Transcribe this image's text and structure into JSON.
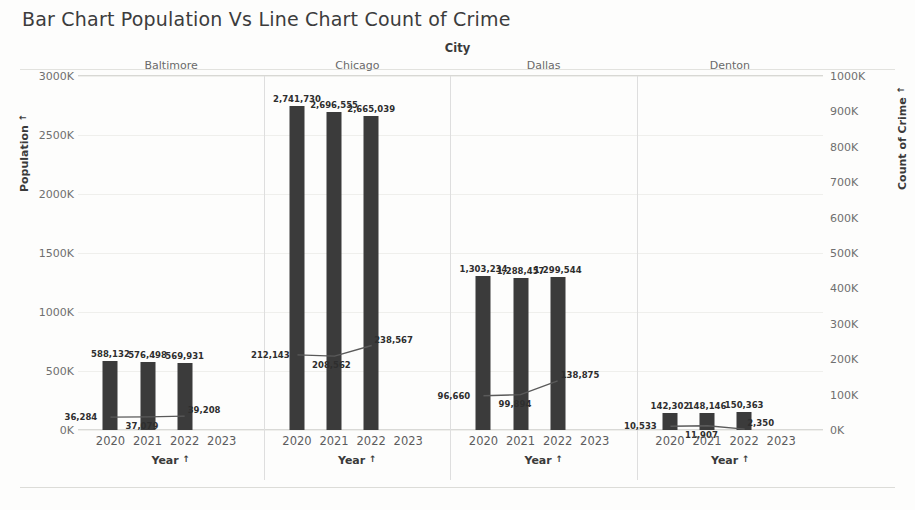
{
  "title": "Bar Chart Population Vs  Line Chart Count of Crime",
  "column_field_label": "City",
  "axis": {
    "left_title": "Population",
    "right_title": "Count of Crime",
    "x_title": "Year",
    "sort_glyph": "↑"
  },
  "chart_data": {
    "type": "bar",
    "title": "Bar Chart Population Vs  Line Chart Count of Crime",
    "subtitle": "",
    "xlabel": "Year",
    "ylabel": "Population",
    "y2label": "Count of Crime",
    "grid": true,
    "legend": "none",
    "panel_field": "City",
    "categories": [
      "2020",
      "2021",
      "2022",
      "2023"
    ],
    "x_tick_labels": [
      "2020",
      "2021",
      "2022",
      "2023"
    ],
    "left_axis": {
      "min": 0,
      "max": 3000,
      "step": 500,
      "unit": "K",
      "tick_labels": [
        "0K",
        "500K",
        "1000K",
        "1500K",
        "2000K",
        "2500K",
        "3000K"
      ],
      "tick_values": [
        0,
        500,
        1000,
        1500,
        2000,
        2500,
        3000
      ]
    },
    "right_axis": {
      "min": 0,
      "max": 1000,
      "step": 100,
      "unit": "K",
      "tick_labels": [
        "0K",
        "100K",
        "200K",
        "300K",
        "400K",
        "500K",
        "600K",
        "700K",
        "800K",
        "900K",
        "1000K"
      ],
      "tick_values": [
        0,
        100,
        200,
        300,
        400,
        500,
        600,
        700,
        800,
        900,
        1000
      ]
    },
    "panels": [
      {
        "name": "Baltimore",
        "bar_series": {
          "name": "Population",
          "years": [
            "2020",
            "2021",
            "2022"
          ],
          "values": [
            588132,
            576498,
            569931
          ],
          "labels": [
            "588,132",
            "576,498",
            "569,931"
          ]
        },
        "line_series": {
          "name": "Count of Crime",
          "years": [
            "2020",
            "2021",
            "2022"
          ],
          "values": [
            36284,
            37079,
            39208
          ],
          "labels": [
            "36,284",
            "37,079",
            "39,208"
          ]
        }
      },
      {
        "name": "Chicago",
        "bar_series": {
          "name": "Population",
          "years": [
            "2020",
            "2021",
            "2022"
          ],
          "values": [
            2741730,
            2696555,
            2665039
          ],
          "labels": [
            "2,741,730",
            "2,696,555",
            "2,665,039"
          ]
        },
        "line_series": {
          "name": "Count of Crime",
          "years": [
            "2020",
            "2021",
            "2022"
          ],
          "values": [
            212143,
            208562,
            238567
          ],
          "labels": [
            "212,143",
            "208,562",
            "238,567"
          ]
        }
      },
      {
        "name": "Dallas",
        "bar_series": {
          "name": "Population",
          "years": [
            "2020",
            "2021",
            "2022"
          ],
          "values": [
            1303234,
            1288457,
            1299544
          ],
          "labels": [
            "1,303,234",
            "1,288,457",
            "1,299,544"
          ]
        },
        "line_series": {
          "name": "Count of Crime",
          "years": [
            "2020",
            "2021",
            "2022"
          ],
          "values": [
            96660,
            99894,
            138875
          ],
          "labels": [
            "96,660",
            "99,894",
            "138,875"
          ]
        }
      },
      {
        "name": "Denton",
        "bar_series": {
          "name": "Population",
          "years": [
            "2020",
            "2021",
            "2022"
          ],
          "values": [
            142302,
            148146,
            150363
          ],
          "labels": [
            "142,302",
            "148,146",
            "150,363"
          ]
        },
        "line_series": {
          "name": "Count of Crime",
          "years": [
            "2020",
            "2021",
            "2022"
          ],
          "values": [
            10533,
            11907,
            2350
          ],
          "labels": [
            "10,533",
            "11,907",
            "2,350"
          ]
        }
      }
    ],
    "colors": {
      "bar": "#3b3b3b",
      "line": "#5a5a5a",
      "grid": "#efefec",
      "text": "#4a4a4a"
    }
  }
}
